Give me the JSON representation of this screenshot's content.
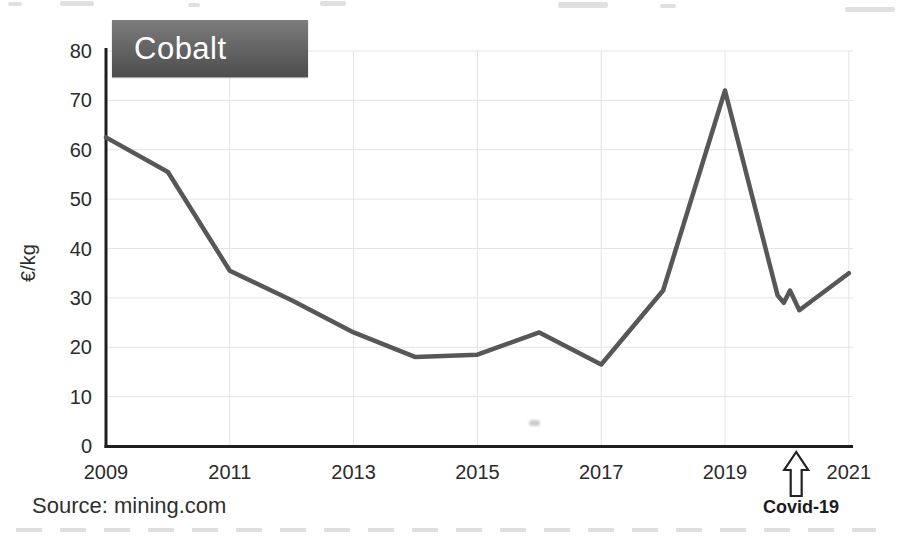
{
  "title_box": {
    "label": "Cobalt",
    "bg_top": "#7d7d7d",
    "bg_bottom": "#4e4e4e",
    "text_color": "#ffffff"
  },
  "source": {
    "text": "Source: mining.com"
  },
  "annotation": {
    "label": "Covid-19",
    "year": 2020.15
  },
  "chart_data": {
    "type": "line",
    "title": "Cobalt",
    "xlabel": "",
    "ylabel": "€/kg",
    "xlim": [
      2009,
      2021
    ],
    "ylim": [
      0,
      80
    ],
    "x_ticks": [
      2009,
      2011,
      2013,
      2015,
      2017,
      2019,
      2021
    ],
    "y_ticks": [
      0,
      10,
      20,
      30,
      40,
      50,
      60,
      70,
      80
    ],
    "grid": true,
    "legend": "none",
    "line_color": "#575757",
    "axis_color": "#1e1e1e",
    "grid_color": "#e4e4e4",
    "tick_label_color": "#2b2b2b",
    "series": [
      {
        "name": "Cobalt price (€/kg)",
        "points": [
          [
            2009,
            62.5
          ],
          [
            2010,
            55.5
          ],
          [
            2011,
            35.5
          ],
          [
            2012,
            29.5
          ],
          [
            2013,
            23
          ],
          [
            2014,
            18
          ],
          [
            2015,
            18.5
          ],
          [
            2016,
            23
          ],
          [
            2017,
            16.5
          ],
          [
            2018,
            31.5
          ],
          [
            2019,
            72
          ],
          [
            2019.85,
            30.5
          ],
          [
            2019.95,
            29
          ],
          [
            2020.05,
            31.5
          ],
          [
            2020.2,
            27.5
          ],
          [
            2021,
            35
          ]
        ]
      }
    ],
    "annotations": [
      {
        "label": "Covid-19",
        "x": 2020.15,
        "type": "up-arrow-below-axis"
      }
    ]
  }
}
